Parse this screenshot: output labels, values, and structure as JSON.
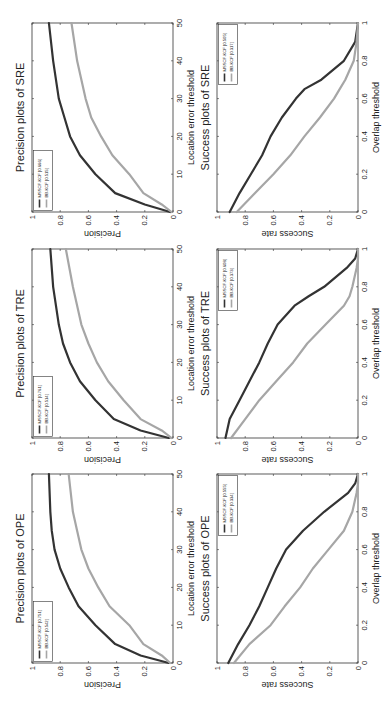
{
  "chart_data": [
    {
      "id": "precision-sre",
      "type": "line",
      "title": "Precision plots of SRE",
      "xlabel": "Location error threshold",
      "ylabel": "Precision",
      "xlim": [
        0,
        50
      ],
      "ylim": [
        0,
        1
      ],
      "xticks": [
        "0",
        "10",
        "20",
        "30",
        "40",
        "50"
      ],
      "yticks": [
        "0",
        "0.2",
        "0.4",
        "0.6",
        "0.8",
        "1"
      ],
      "legend_position": "top-left",
      "x": [
        0,
        2,
        5,
        10,
        15,
        20,
        25,
        30,
        40,
        50
      ],
      "series": [
        {
          "name": "MSSCF-KCF [0.666]",
          "color": "#333333",
          "values": [
            0.02,
            0.2,
            0.41,
            0.55,
            0.66,
            0.73,
            0.77,
            0.81,
            0.85,
            0.88
          ]
        },
        {
          "name": "BB-KCF [0.515]",
          "color": "#a6a6a6",
          "values": [
            0.01,
            0.08,
            0.21,
            0.31,
            0.43,
            0.51,
            0.58,
            0.62,
            0.68,
            0.72
          ]
        }
      ]
    },
    {
      "id": "success-sre",
      "type": "line",
      "title": "Success plots of SRE",
      "xlabel": "Overlap threshold",
      "ylabel": "Success rate",
      "xlim": [
        0,
        1
      ],
      "ylim": [
        0,
        1
      ],
      "xticks": [
        "0",
        "0.2",
        "0.4",
        "0.6",
        "0.8",
        "1"
      ],
      "yticks": [
        "0",
        "0.2",
        "0.4",
        "0.6",
        "0.8",
        "1"
      ],
      "legend_position": "top-right",
      "x": [
        0,
        0.1,
        0.2,
        0.3,
        0.4,
        0.5,
        0.6,
        0.65,
        0.7,
        0.8,
        0.9,
        1.0
      ],
      "series": [
        {
          "name": "MSSCF-KCF [0.505]",
          "color": "#333333",
          "values": [
            0.91,
            0.84,
            0.76,
            0.68,
            0.62,
            0.54,
            0.44,
            0.38,
            0.26,
            0.1,
            0.02,
            0.0
          ]
        },
        {
          "name": "BB-KCF [0.317]",
          "color": "#a6a6a6",
          "values": [
            0.86,
            0.73,
            0.6,
            0.48,
            0.38,
            0.27,
            0.17,
            0.13,
            0.09,
            0.03,
            0.01,
            0.0
          ]
        }
      ]
    },
    {
      "id": "precision-tre",
      "type": "line",
      "title": "Precision plots of TRE",
      "xlabel": "Location error threshold",
      "ylabel": "Precision",
      "xlim": [
        0,
        50
      ],
      "ylim": [
        0,
        1
      ],
      "xticks": [
        "0",
        "10",
        "20",
        "30",
        "40",
        "50"
      ],
      "yticks": [
        "0",
        "0.2",
        "0.4",
        "0.6",
        "0.8",
        "1"
      ],
      "legend_position": "top-left",
      "x": [
        0,
        2,
        5,
        10,
        15,
        20,
        25,
        30,
        40,
        50
      ],
      "series": [
        {
          "name": "MSSCF-KCF [0.761]",
          "color": "#333333",
          "values": [
            0.03,
            0.23,
            0.42,
            0.55,
            0.66,
            0.73,
            0.78,
            0.81,
            0.85,
            0.87
          ]
        },
        {
          "name": "BB-KCF [0.514]",
          "color": "#a6a6a6",
          "values": [
            0.01,
            0.08,
            0.23,
            0.35,
            0.46,
            0.54,
            0.6,
            0.65,
            0.71,
            0.76
          ]
        }
      ]
    },
    {
      "id": "success-tre",
      "type": "line",
      "title": "Success plots of TRE",
      "xlabel": "Overlap threshold",
      "ylabel": "Success rate",
      "xlim": [
        0,
        1
      ],
      "ylim": [
        0,
        1
      ],
      "xticks": [
        "0",
        "0.2",
        "0.4",
        "0.6",
        "0.8",
        "1"
      ],
      "yticks": [
        "0",
        "0.2",
        "0.4",
        "0.6",
        "0.8",
        "1"
      ],
      "legend_position": "top-right",
      "x": [
        0,
        0.1,
        0.2,
        0.3,
        0.4,
        0.5,
        0.6,
        0.7,
        0.75,
        0.8,
        0.9,
        0.95,
        1.0
      ],
      "series": [
        {
          "name": "MSSCF-KCF [0.608]",
          "color": "#333333",
          "values": [
            0.94,
            0.91,
            0.84,
            0.77,
            0.7,
            0.64,
            0.57,
            0.45,
            0.35,
            0.24,
            0.08,
            0.02,
            0.0
          ]
        },
        {
          "name": "BB-KCF [0.373]",
          "color": "#a6a6a6",
          "values": [
            0.9,
            0.8,
            0.7,
            0.58,
            0.46,
            0.36,
            0.23,
            0.1,
            0.06,
            0.04,
            0.01,
            0.0,
            0.0
          ]
        }
      ]
    },
    {
      "id": "precision-ope",
      "type": "line",
      "title": "Precision plots of OPE",
      "xlabel": "Location error threshold",
      "ylabel": "Precision",
      "xlim": [
        0,
        50
      ],
      "ylim": [
        0,
        1
      ],
      "xticks": [
        "0",
        "10",
        "20",
        "30",
        "40",
        "50"
      ],
      "yticks": [
        "0",
        "0.2",
        "0.4",
        "0.6",
        "0.8",
        "1"
      ],
      "legend_position": "top-left",
      "x": [
        0,
        2,
        5,
        10,
        15,
        20,
        25,
        30,
        35,
        40,
        50
      ],
      "series": [
        {
          "name": "MSSCF-KCF [0.751]",
          "color": "#333333",
          "values": [
            0.03,
            0.23,
            0.41,
            0.55,
            0.67,
            0.74,
            0.8,
            0.84,
            0.86,
            0.87,
            0.88
          ]
        },
        {
          "name": "BB-KCF [0.542]",
          "color": "#a6a6a6",
          "values": [
            0.02,
            0.08,
            0.21,
            0.31,
            0.45,
            0.53,
            0.6,
            0.65,
            0.68,
            0.71,
            0.74
          ]
        }
      ]
    },
    {
      "id": "success-ope",
      "type": "line",
      "title": "Success plots of OPE",
      "xlabel": "Overlap threshold",
      "ylabel": "Success rate",
      "xlim": [
        0,
        1
      ],
      "ylim": [
        0,
        1
      ],
      "xticks": [
        "0",
        "0.2",
        "0.4",
        "0.6",
        "0.8",
        "1"
      ],
      "yticks": [
        "0",
        "0.2",
        "0.4",
        "0.6",
        "0.8",
        "1"
      ],
      "legend_position": "top-right",
      "x": [
        0,
        0.1,
        0.2,
        0.3,
        0.4,
        0.5,
        0.6,
        0.7,
        0.8,
        0.9,
        0.95,
        1.0
      ],
      "series": [
        {
          "name": "MSSCF-KCF [0.555]",
          "color": "#333333",
          "values": [
            0.92,
            0.85,
            0.77,
            0.7,
            0.64,
            0.58,
            0.51,
            0.39,
            0.24,
            0.07,
            0.02,
            0.0
          ]
        },
        {
          "name": "BB-KCF [0.334]",
          "color": "#a6a6a6",
          "values": [
            0.88,
            0.77,
            0.62,
            0.52,
            0.41,
            0.32,
            0.21,
            0.1,
            0.04,
            0.01,
            0.0,
            0.0
          ]
        }
      ]
    }
  ]
}
